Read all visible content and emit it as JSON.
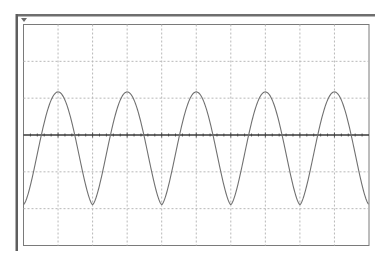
{
  "display": {
    "type": "oscilloscope-screen",
    "trigger_marker": "down-triangle",
    "colors": {
      "frame": "#6e6e6e",
      "plot_border": "#7a7a7a",
      "grid": "#b8b8b8",
      "center_axis": "#3a3a3a",
      "trace": "#707070",
      "background": "#ffffff"
    },
    "grid": {
      "horizontal_divisions": 10,
      "vertical_divisions": 6,
      "minor_ticks_per_division": 5
    }
  },
  "chart_data": {
    "type": "line",
    "title": "",
    "xlabel": "",
    "ylabel": "",
    "grid": true,
    "x_divisions": 10,
    "y_divisions": 6,
    "xlim": [
      0,
      10
    ],
    "ylim": [
      -3,
      3
    ],
    "series": [
      {
        "name": "trace",
        "description": "periodic waveform, ~5 cycles across screen, period 2 div, rounded peaks at +1.2 div, sharper troughs at -1.9 div",
        "period_div": 2.0,
        "peak_div": 1.17,
        "trough_div": -1.89,
        "peaks_x_div": [
          1.0,
          3.0,
          5.0,
          7.0,
          9.0
        ],
        "troughs_x_div": [
          0.0,
          2.0,
          4.0,
          6.0,
          8.0,
          10.0
        ]
      }
    ]
  }
}
